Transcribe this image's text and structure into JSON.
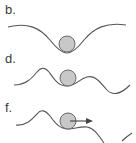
{
  "panels": [
    {
      "label": "b.",
      "description": "ball resting at bottom of single deep well"
    },
    {
      "label": "d.",
      "description": "ball in shallow local minimum between hills"
    },
    {
      "label": "f.",
      "description": "ball pushed out of local minimum, arrow indicating motion to the right"
    }
  ],
  "colors": {
    "curve": "#555555",
    "ball_fill": "#c8c8c8",
    "ball_stroke": "#6a6a6a",
    "arrow": "#444444",
    "label": "#3a3a3a"
  }
}
